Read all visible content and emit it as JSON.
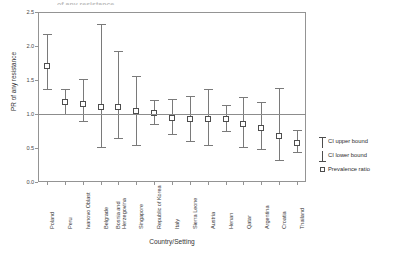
{
  "figure": {
    "top_clipped_text": "of any resistance",
    "x_axis_title": "Country/Setting",
    "y_axis_title": "PR of any resistance"
  },
  "legend": {
    "items": [
      {
        "label": "CI upper bound",
        "glyph": "error-bar-upper-icon"
      },
      {
        "label": "CI lower bound",
        "glyph": "error-bar-lower-icon"
      },
      {
        "label": "Prevalence ratio",
        "glyph": "open-square-marker-icon"
      }
    ]
  },
  "chart_data": {
    "type": "scatter",
    "title": "",
    "subtitle": "",
    "xlabel": "Country/Setting",
    "ylabel": "PR of any resistance",
    "ylim": [
      0.0,
      2.5
    ],
    "yticks": [
      "0.0",
      "0.5",
      "1.0",
      "1.5",
      "2.0",
      "2.5"
    ],
    "ytick_values": [
      0.0,
      0.5,
      1.0,
      1.5,
      2.0,
      2.5
    ],
    "grid": false,
    "reference_line": 1.0,
    "legend_position": "right",
    "categories": [
      "Poland",
      "Peru",
      "Ivanovo Oblast",
      "Belgrade",
      "Bosnia and Herzegovina",
      "Singapore",
      "Republic of Korea",
      "Italy",
      "Sierra Leone",
      "Austria",
      "Henan",
      "Qatar",
      "Argentina",
      "Croatia",
      "Thailand"
    ],
    "series": [
      {
        "name": "Prevalence ratio",
        "values": [
          1.71,
          1.18,
          1.15,
          1.11,
          1.11,
          1.04,
          1.02,
          0.94,
          0.92,
          0.93,
          0.92,
          0.85,
          0.79,
          0.67,
          0.58
        ]
      },
      {
        "name": "CI upper bound",
        "values": [
          2.17,
          1.37,
          1.51,
          2.33,
          1.93,
          1.56,
          1.2,
          1.22,
          1.27,
          1.37,
          1.13,
          1.25,
          1.17,
          1.38,
          0.76
        ]
      },
      {
        "name": "CI lower bound",
        "values": [
          1.37,
          1.0,
          0.89,
          0.52,
          0.65,
          0.55,
          0.86,
          0.7,
          0.61,
          0.55,
          0.75,
          0.52,
          0.48,
          0.33,
          0.44
        ]
      }
    ]
  }
}
